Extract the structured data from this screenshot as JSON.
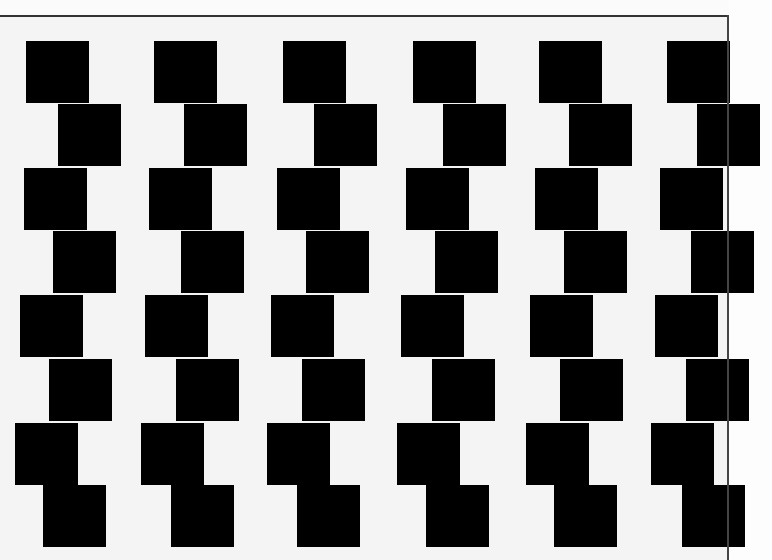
{
  "image": {
    "description": "Cafe wall illusion: staggered rows of black squares on light background",
    "colors": {
      "background": "#f4f4f4",
      "square": "#000000",
      "border": "#333333"
    },
    "square_size": {
      "w": 63,
      "h": 62
    }
  },
  "rows": [
    {
      "y": 41,
      "xs": [
        26,
        154,
        283,
        413,
        539,
        667
      ]
    },
    {
      "y": 104,
      "xs": [
        58,
        184,
        314,
        443,
        569,
        697
      ]
    },
    {
      "y": 168,
      "xs": [
        24,
        149,
        277,
        406,
        535,
        660
      ]
    },
    {
      "y": 231,
      "xs": [
        53,
        181,
        306,
        435,
        564,
        691
      ]
    },
    {
      "y": 295,
      "xs": [
        20,
        145,
        271,
        401,
        530,
        655
      ]
    },
    {
      "y": 359,
      "xs": [
        49,
        176,
        302,
        432,
        560,
        686
      ]
    },
    {
      "y": 423,
      "xs": [
        15,
        141,
        267,
        397,
        526,
        651
      ]
    },
    {
      "y": 485,
      "xs": [
        43,
        171,
        297,
        426,
        554,
        682
      ]
    }
  ]
}
